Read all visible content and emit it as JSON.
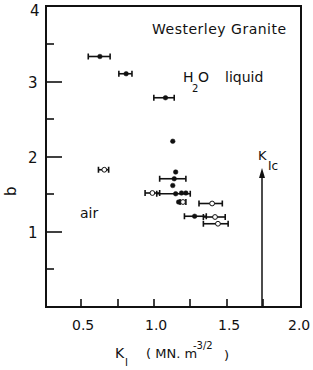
{
  "chart_data": {
    "type": "scatter",
    "title": "Westerley Granite",
    "xlabel": "K_I (MN.m^-3/2)",
    "ylabel": "b",
    "xlim": [
      0.25,
      2.0
    ],
    "ylim": [
      0,
      4
    ],
    "x_ticks": [
      "0.5",
      "1.0",
      "1.5",
      "2.0"
    ],
    "y_ticks": [
      "1",
      "2",
      "3",
      "4"
    ],
    "grid": false,
    "annotations": [
      {
        "text": "Westerley Granite",
        "x": 1.35,
        "y": 3.65
      },
      {
        "text": "H2O liquid",
        "x": 1.5,
        "y": 3.0
      },
      {
        "text": "air",
        "x": 0.6,
        "y": 1.3
      },
      {
        "text": "K_Ic",
        "x": 1.75,
        "y": 1.9,
        "arrow_from": [
          1.75,
          0.0
        ],
        "arrow_to": [
          1.75,
          1.85
        ]
      }
    ],
    "series": [
      {
        "name": "H2O liquid",
        "marker": "filled-circle",
        "points": [
          {
            "x": 0.62,
            "y": 3.34,
            "xerr": [
              0.54,
              0.69
            ]
          },
          {
            "x": 0.8,
            "y": 3.11,
            "xerr": [
              0.75,
              0.84
            ]
          },
          {
            "x": 1.07,
            "y": 2.79,
            "xerr": [
              0.99,
              1.13
            ]
          },
          {
            "x": 1.12,
            "y": 2.21
          },
          {
            "x": 1.14,
            "y": 1.8
          },
          {
            "x": 1.13,
            "y": 1.71,
            "xerr": [
              1.03,
              1.21
            ]
          },
          {
            "x": 1.12,
            "y": 1.62
          },
          {
            "x": 1.14,
            "y": 1.51,
            "xerr": [
              1.01,
              1.24
            ]
          },
          {
            "x": 1.18,
            "y": 1.52
          },
          {
            "x": 1.21,
            "y": 1.52
          },
          {
            "x": 1.16,
            "y": 1.4
          },
          {
            "x": 1.27,
            "y": 1.21,
            "xerr": [
              1.2,
              1.35
            ]
          }
        ]
      },
      {
        "name": "air",
        "marker": "open-circle",
        "points": [
          {
            "x": 0.65,
            "y": 1.83,
            "xerr": [
              0.61,
              0.68
            ]
          },
          {
            "x": 0.98,
            "y": 1.52,
            "xerr": [
              0.93,
              1.03
            ]
          },
          {
            "x": 1.19,
            "y": 1.4,
            "xerr": [
              1.17,
              1.21
            ]
          },
          {
            "x": 1.39,
            "y": 1.38,
            "xerr": [
              1.3,
              1.46
            ]
          },
          {
            "x": 1.41,
            "y": 1.2,
            "xerr": [
              1.33,
              1.48
            ]
          },
          {
            "x": 1.43,
            "y": 1.11,
            "xerr": [
              1.33,
              1.5
            ]
          }
        ]
      }
    ]
  },
  "labels": {
    "title": "Westerley Granite",
    "h2o_H": "H",
    "h2o_sub": "2",
    "h2o_O": "O",
    "h2o_liquid": "liquid",
    "air": "air",
    "kic_K": "K",
    "kic_sub": "Ic",
    "ylabel": "b",
    "xlabel_K": "K",
    "xlabel_sub": "I",
    "xlabel_units": "( MN. m",
    "xlabel_exp": "-3/2",
    "xlabel_close": ")",
    "xt0": "0.5",
    "xt1": "1.0",
    "xt2": "1.5",
    "xt3": "2.0",
    "yt1": "1",
    "yt2": "2",
    "yt3": "3",
    "yt4": "4"
  }
}
